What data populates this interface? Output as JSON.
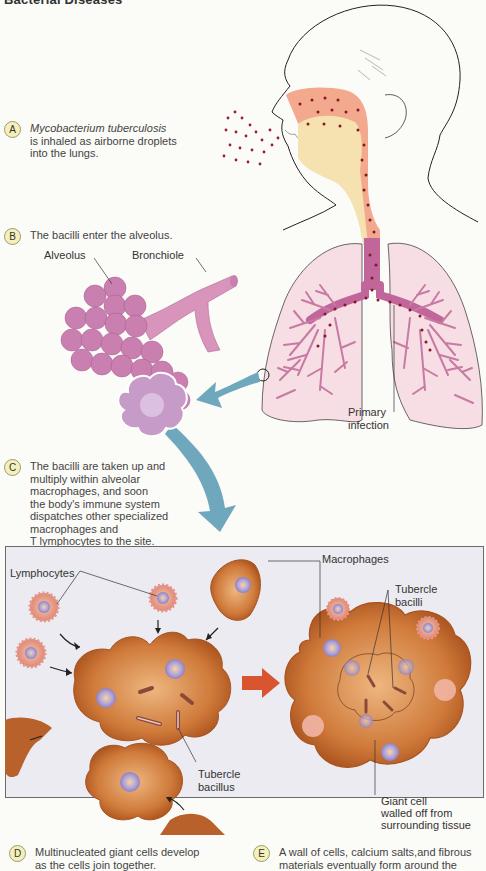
{
  "header": {
    "title": "Bacterial Diseases"
  },
  "steps": [
    {
      "letter": "A",
      "italic": "Mycobacterium tuberculosis",
      "text_lines": [
        "is inhaled as airborne droplets",
        "into the lungs."
      ]
    },
    {
      "letter": "B",
      "text_lines": [
        "The bacilli enter the alveolus."
      ]
    },
    {
      "letter": "C",
      "text_lines": [
        "The bacilli are taken up and",
        "multiply within alveolar",
        "macrophages, and soon",
        "the body's immune system",
        "dispatches other specialized",
        "macrophages and",
        "T lymphocytes to the site."
      ]
    },
    {
      "letter": "D",
      "text_lines": [
        "Multinucleated giant cells develop",
        "as the cells join together."
      ]
    },
    {
      "letter": "E",
      "text_lines": [
        "A wall of cells, calcium salts,and fibrous",
        "materials eventually form around the"
      ]
    }
  ],
  "labels": {
    "alveolus": "Alveolus",
    "bronchiole": "Bronchiole",
    "primary_infection": [
      "Primary",
      "infection"
    ],
    "lymphocytes": "Lymphocytes",
    "macrophages": "Macrophages",
    "tubercle_bacilli": [
      "Tubercle",
      "bacilli"
    ],
    "tubercle_bacillus": [
      "Tubercle",
      "bacillus"
    ],
    "giant_cell": [
      "Giant cell",
      "walled off from",
      "surrounding tissue"
    ]
  },
  "colors": {
    "airway_orange": "#f2a98e",
    "airway_cream": "#f6e2b0",
    "droplet": "#9b1b2a",
    "lung_fill": "#f7dde4",
    "bronchi": "#c77aa2",
    "trachea": "#c0669a",
    "alveolus": "#c97fb0",
    "blue_arrow": "#6fa8bd",
    "macrophage": "#c56d2e",
    "macrophage_light": "#e7a466",
    "nucleus": "#a79ad0",
    "lymphocyte": "#e6958a",
    "red_arrow": "#d9552f",
    "panel_bg": "#ebebf1",
    "badge_bg": "#f4f0b8"
  }
}
